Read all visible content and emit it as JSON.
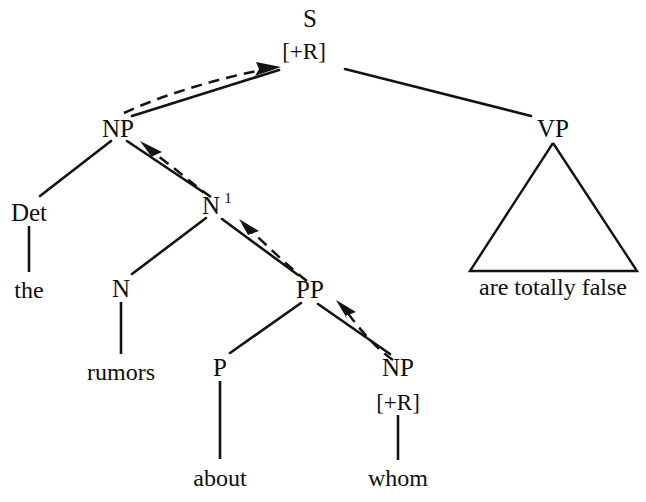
{
  "diagram": {
    "kind": "syntactic-tree",
    "background_color": "#ffffff",
    "ink_color": "#141310",
    "nodes": {
      "s": {
        "label": "S",
        "feature": "[+R]"
      },
      "np_subject": {
        "label": "NP"
      },
      "det": {
        "label": "Det"
      },
      "n_bar": {
        "label": "N",
        "superscript": "1"
      },
      "n": {
        "label": "N"
      },
      "pp": {
        "label": "PP"
      },
      "p": {
        "label": "P"
      },
      "np_object": {
        "label": "NP",
        "feature": "[+R]"
      },
      "vp": {
        "label": "VP"
      }
    },
    "terminals": {
      "det_word": "the",
      "n_word": "rumors",
      "p_word": "about",
      "np_object_word": "whom",
      "vp_phrase": "are totally false"
    },
    "movement_arrows": [
      {
        "name": "np-object-to-pp",
        "from": "np_object",
        "to": "pp"
      },
      {
        "name": "pp-to-n-bar",
        "from": "pp",
        "to": "n_bar"
      },
      {
        "name": "n-bar-to-np-subject",
        "from": "n_bar",
        "to": "np_subject"
      },
      {
        "name": "np-subject-to-s",
        "from": "np_subject",
        "to": "s"
      }
    ]
  }
}
